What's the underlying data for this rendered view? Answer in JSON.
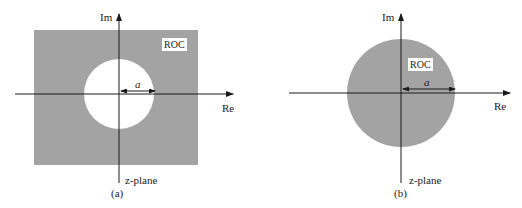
{
  "colors": {
    "roc_fill": "#a3a3a3",
    "background": "#ffffff",
    "axis": "#1a1a1a"
  },
  "panels": [
    {
      "id": "a",
      "caption": "(a)",
      "plane_label": "z-plane",
      "axis_labels": {
        "imag": "Im",
        "real": "Re"
      },
      "roc_label": "ROC",
      "radius_label": "a",
      "roc_type": "exterior",
      "description": "ROC is the region outside a circle of radius a (|z| > a)"
    },
    {
      "id": "b",
      "caption": "(b)",
      "plane_label": "z-plane",
      "axis_labels": {
        "imag": "Im",
        "real": "Re"
      },
      "roc_label": "ROC",
      "radius_label": "a",
      "roc_type": "interior",
      "description": "ROC is the region inside a circle of radius a (|z| < a)"
    }
  ]
}
